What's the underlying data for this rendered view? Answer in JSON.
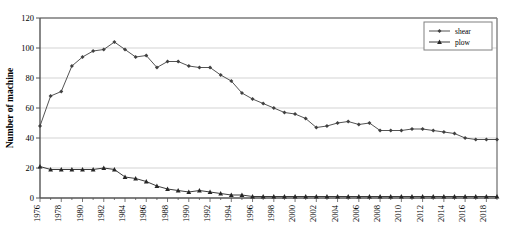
{
  "chart_data": {
    "type": "line",
    "title": "",
    "xlabel": "",
    "ylabel": "Number of machine",
    "ylim": [
      0,
      120
    ],
    "yticks": [
      0,
      20,
      40,
      60,
      80,
      100,
      120
    ],
    "xlim": [
      1976,
      2019
    ],
    "xticks": [
      1976,
      1978,
      1980,
      1982,
      1984,
      1986,
      1988,
      1990,
      1992,
      1994,
      1996,
      1998,
      2000,
      2002,
      2004,
      2006,
      2008,
      2010,
      2012,
      2014,
      2016,
      2018
    ],
    "xtick_rotation": "vertical",
    "grid": "horizontal",
    "legend_position": "top-right",
    "x": [
      1976,
      1977,
      1978,
      1979,
      1980,
      1981,
      1982,
      1983,
      1984,
      1985,
      1986,
      1987,
      1988,
      1989,
      1990,
      1991,
      1992,
      1993,
      1994,
      1995,
      1996,
      1997,
      1998,
      1999,
      2000,
      2001,
      2002,
      2003,
      2004,
      2005,
      2006,
      2007,
      2008,
      2009,
      2010,
      2011,
      2012,
      2013,
      2014,
      2015,
      2016,
      2017,
      2018,
      2019
    ],
    "series": [
      {
        "name": "shear",
        "marker": "diamond",
        "color": "#404040",
        "values": [
          48,
          68,
          71,
          88,
          94,
          98,
          99,
          104,
          99,
          94,
          95,
          87,
          91,
          91,
          88,
          87,
          87,
          82,
          78,
          70,
          66,
          63,
          60,
          57,
          56,
          53,
          47,
          48,
          50,
          51,
          49,
          50,
          45,
          45,
          45,
          46,
          46,
          45,
          44,
          43,
          40,
          39,
          39,
          39
        ]
      },
      {
        "name": "plow",
        "marker": "triangle",
        "color": "#262626",
        "values": [
          21,
          19,
          19,
          19,
          19,
          19,
          20,
          19,
          14,
          13,
          11,
          8,
          6,
          5,
          4,
          5,
          4,
          3,
          2,
          2,
          1,
          1,
          1,
          1,
          1,
          1,
          1,
          1,
          1,
          1,
          1,
          1,
          1,
          1,
          1,
          1,
          1,
          1,
          1,
          1,
          1,
          1,
          1,
          1
        ]
      }
    ]
  },
  "legend": {
    "items": [
      {
        "label": "shear"
      },
      {
        "label": "plow"
      }
    ]
  },
  "axis": {
    "y_title": "Number of machine",
    "y_tick_labels": [
      "0",
      "20",
      "40",
      "60",
      "80",
      "100",
      "120"
    ],
    "x_tick_labels": [
      "1976",
      "1978",
      "1980",
      "1982",
      "1984",
      "1986",
      "1988",
      "1990",
      "1992",
      "1994",
      "1996",
      "1998",
      "2000",
      "2002",
      "2004",
      "2006",
      "2008",
      "2010",
      "2012",
      "2014",
      "2016",
      "2018"
    ]
  },
  "colors": {
    "series_shear": "#404040",
    "series_plow": "#262626",
    "grid": "#c8c8c8",
    "frame": "#808080",
    "axis": "#555555"
  }
}
